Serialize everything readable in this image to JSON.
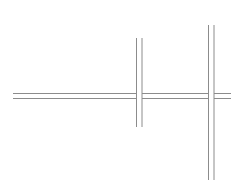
{
  "canvas": {
    "width": 239,
    "height": 187,
    "background": "#ffffff"
  },
  "stroke": {
    "color": "#8c8c8c",
    "width": 1
  },
  "horizontal_pair": {
    "y1": 93.5,
    "y2": 98.5,
    "segments": [
      {
        "x1": 13,
        "x2": 136.5
      },
      {
        "x1": 142,
        "x2": 208.5
      },
      {
        "x1": 214,
        "x2": 231
      }
    ]
  },
  "vertical_pairs": [
    {
      "name": "left-crossing",
      "x1": 136.5,
      "x2": 142,
      "y1": 38,
      "y2": 127
    },
    {
      "name": "right-crossing",
      "x1": 208.5,
      "x2": 214,
      "y1": 25,
      "y2": 180
    }
  ]
}
